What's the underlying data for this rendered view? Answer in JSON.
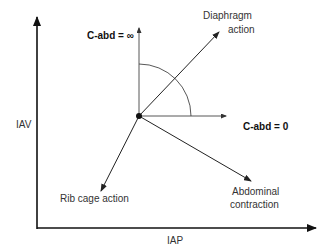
{
  "diagram": {
    "axes": {
      "y_label": "IAV",
      "x_label": "IAP"
    },
    "vectors": {
      "vertical_label": "C-abd = ∞",
      "horizontal_label": "C-abd = 0",
      "diaphragm_line1": "Diaphragm",
      "diaphragm_line2": "action",
      "ribcage": "Rib cage action",
      "abdominal_line1": "Abdominal",
      "abdominal_line2": "contraction"
    },
    "colors": {
      "line": "#222222",
      "background": "#ffffff"
    }
  }
}
